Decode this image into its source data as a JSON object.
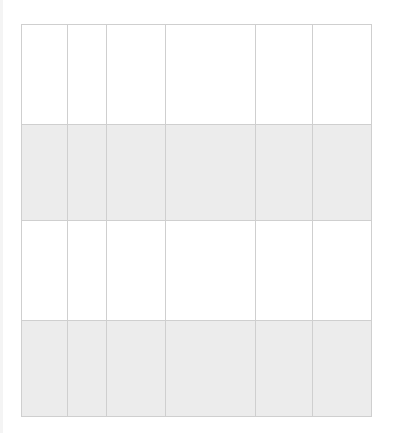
{
  "grid": {
    "columns": 6,
    "column_widths_px": [
      46,
      39,
      59,
      90,
      57,
      59
    ],
    "rows": [
      {
        "style": "white",
        "height_px": 100,
        "cells": [
          "",
          "",
          "",
          "",
          "",
          ""
        ]
      },
      {
        "style": "gray",
        "height_px": 96,
        "cells": [
          "",
          "",
          "",
          "",
          "",
          ""
        ]
      },
      {
        "style": "white",
        "height_px": 100,
        "cells": [
          "",
          "",
          "",
          "",
          "",
          ""
        ]
      },
      {
        "style": "gray",
        "height_px": 95,
        "cells": [
          "",
          "",
          "",
          "",
          "",
          ""
        ]
      }
    ]
  },
  "colors": {
    "background": "#ffffff",
    "row_alt": "#ececec",
    "grid_line": "#cfcfcf"
  }
}
